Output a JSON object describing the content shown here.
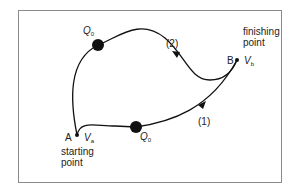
{
  "diagram": {
    "type": "path-independence / work done moving a charge",
    "start": {
      "point": "A",
      "potential": "V",
      "potential_sub": "a",
      "caption_line1": "starting",
      "caption_line2": "point"
    },
    "finish": {
      "point": "B",
      "potential": "V",
      "potential_sub": "b",
      "caption_line1": "finishing",
      "caption_line2": "point"
    },
    "paths": [
      {
        "id": "1",
        "label": "(1)",
        "charge": "Q",
        "charge_sub": "0"
      },
      {
        "id": "2",
        "label": "(2)",
        "charge": "Q",
        "charge_sub": "0"
      }
    ],
    "colors": {
      "line": "#111111",
      "frame": "#8a8a8a",
      "charge": "#111111"
    }
  }
}
